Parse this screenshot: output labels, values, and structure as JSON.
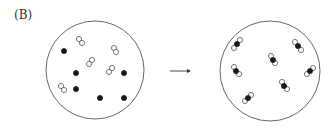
{
  "figure": {
    "label": "(B)",
    "colors": {
      "outline": "#555555",
      "filled_atom": "#1a1a1a",
      "open_atom": "#ffffff"
    },
    "before": {
      "container": {
        "cx": 95,
        "cy": 70,
        "r": 49
      },
      "open_pairs": [
        [
          [
            79,
            39
          ],
          [
            82,
            43
          ]
        ],
        [
          [
            114,
            48
          ],
          [
            116,
            52
          ]
        ],
        [
          [
            92,
            60
          ],
          [
            89,
            64
          ]
        ],
        [
          [
            112,
            68
          ],
          [
            109,
            72
          ]
        ],
        [
          [
            61,
            86
          ],
          [
            64,
            90
          ]
        ]
      ],
      "filled_atoms": [
        [
          64,
          51
        ],
        [
          76,
          73
        ],
        [
          124,
          73
        ],
        [
          76,
          89
        ],
        [
          100,
          98
        ],
        [
          124,
          98
        ]
      ]
    },
    "arrow": {
      "x1": 170,
      "y1": 71,
      "x2": 191,
      "y2": 71
    },
    "after": {
      "container": {
        "cx": 270,
        "cy": 71,
        "r": 50
      },
      "triatomic_molecules": [
        [
          [
            234,
            48
          ],
          [
            237,
            44
          ],
          [
            240,
            40
          ]
        ],
        [
          [
            295,
            42
          ],
          [
            298,
            46
          ],
          [
            301,
            50
          ]
        ],
        [
          [
            271,
            56
          ],
          [
            273,
            60
          ],
          [
            275,
            63
          ]
        ],
        [
          [
            234,
            67
          ],
          [
            236,
            71
          ],
          [
            239,
            74
          ]
        ],
        [
          [
            307,
            74
          ],
          [
            310,
            71
          ],
          [
            313,
            68
          ]
        ],
        [
          [
            282,
            82
          ],
          [
            284,
            86
          ],
          [
            287,
            89
          ]
        ],
        [
          [
            245,
            101
          ],
          [
            248,
            98
          ],
          [
            251,
            95
          ]
        ]
      ]
    }
  }
}
